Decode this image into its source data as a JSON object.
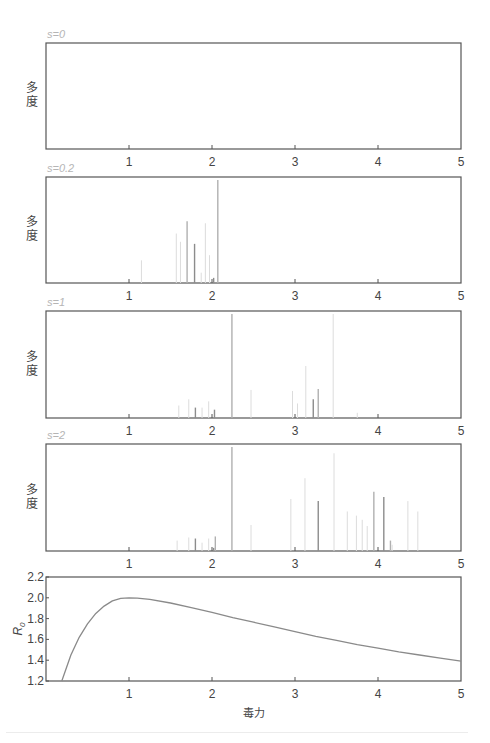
{
  "figure": {
    "x_axis_label": "毒力",
    "ylabel_panels": "多度",
    "xlim": [
      0,
      5
    ],
    "x_ticks": [
      "1",
      "2",
      "3",
      "4",
      "5"
    ],
    "colors": {
      "frame": "#555555",
      "panel_title": "#b5b5b5",
      "curve": "#8a8a8a",
      "spike_dark": "#8c8c8c",
      "spike_mid": "#b0b0b0",
      "spike_light": "#dcdcdc"
    }
  },
  "chart_data": [
    {
      "type": "bar",
      "title": "s=0",
      "xlabel": "",
      "ylabel": "多度",
      "xlim": [
        0,
        5
      ],
      "x_ticks": [
        1,
        2,
        3,
        4,
        5
      ],
      "note": "no visible spikes",
      "x": [],
      "values": [],
      "shade": []
    },
    {
      "type": "bar",
      "title": "s=0.2",
      "xlabel": "",
      "ylabel": "多度",
      "xlim": [
        0,
        5
      ],
      "x_ticks": [
        1,
        2,
        3,
        4,
        5
      ],
      "x": [
        1.15,
        1.57,
        1.62,
        1.7,
        1.79,
        1.87,
        1.92,
        1.97,
        2.02,
        2.07
      ],
      "values": [
        0.22,
        0.48,
        0.4,
        0.6,
        0.38,
        0.1,
        0.58,
        0.27,
        0.05,
        1.0
      ],
      "shade": [
        "light",
        "light",
        "light",
        "mid",
        "dark",
        "light",
        "light",
        "light",
        "dark",
        "mid"
      ]
    },
    {
      "type": "bar",
      "title": "s=1",
      "xlabel": "",
      "ylabel": "多度",
      "xlim": [
        0,
        5
      ],
      "x_ticks": [
        1,
        2,
        3,
        4,
        5
      ],
      "x": [
        1.6,
        1.72,
        1.8,
        1.88,
        1.96,
        2.03,
        2.24,
        2.47,
        2.97,
        3.03,
        3.13,
        3.22,
        3.28,
        3.46,
        3.75
      ],
      "values": [
        0.12,
        0.18,
        0.1,
        0.1,
        0.16,
        0.08,
        1.0,
        0.27,
        0.26,
        0.14,
        0.5,
        0.18,
        0.28,
        1.0,
        0.05
      ],
      "shade": [
        "light",
        "light",
        "dark",
        "light",
        "light",
        "dark",
        "mid",
        "light",
        "light",
        "light",
        "light",
        "dark",
        "mid",
        "light",
        "light"
      ]
    },
    {
      "type": "bar",
      "title": "s=2",
      "xlabel": "",
      "ylabel": "多度",
      "xlim": [
        0,
        5
      ],
      "x_ticks": [
        1,
        2,
        3,
        4,
        5
      ],
      "x": [
        1.58,
        1.72,
        1.8,
        1.88,
        1.96,
        2.02,
        2.04,
        2.24,
        2.47,
        2.95,
        3.12,
        3.28,
        3.47,
        3.63,
        3.74,
        3.81,
        3.87,
        3.95,
        4.07,
        4.15,
        4.17,
        4.36,
        4.48
      ],
      "values": [
        0.1,
        0.13,
        0.12,
        0.08,
        0.12,
        0.03,
        0.14,
        1.0,
        0.25,
        0.5,
        0.7,
        0.48,
        0.94,
        0.38,
        0.34,
        0.3,
        0.24,
        0.57,
        0.52,
        0.1,
        0.06,
        0.48,
        0.38
      ],
      "shade": [
        "light",
        "light",
        "dark",
        "light",
        "light",
        "dark",
        "mid",
        "mid",
        "light",
        "light",
        "light",
        "dark",
        "light",
        "light",
        "light",
        "light",
        "light",
        "mid",
        "dark",
        "mid",
        "light",
        "light",
        "light"
      ]
    },
    {
      "type": "line",
      "title": "",
      "xlabel": "毒力",
      "ylabel": "R0",
      "xlim": [
        0,
        5
      ],
      "ylim": [
        1.2,
        2.2
      ],
      "x_ticks": [
        1,
        2,
        3,
        4,
        5
      ],
      "y_ticks": [
        "1.2",
        "1.4",
        "1.6",
        "1.8",
        "2.0",
        "2.2"
      ],
      "series": [
        {
          "name": "R0",
          "x": [
            0.19,
            0.3,
            0.4,
            0.5,
            0.6,
            0.7,
            0.8,
            0.9,
            1.0,
            1.1,
            1.25,
            1.5,
            1.75,
            2.0,
            2.25,
            2.5,
            2.75,
            3.0,
            3.25,
            3.5,
            3.75,
            4.0,
            4.25,
            4.5,
            4.75,
            5.0
          ],
          "values": [
            1.2,
            1.45,
            1.62,
            1.75,
            1.85,
            1.92,
            1.97,
            1.995,
            2.0,
            1.997,
            1.985,
            1.95,
            1.905,
            1.86,
            1.81,
            1.765,
            1.72,
            1.675,
            1.63,
            1.59,
            1.55,
            1.515,
            1.48,
            1.45,
            1.42,
            1.39
          ]
        }
      ]
    }
  ]
}
